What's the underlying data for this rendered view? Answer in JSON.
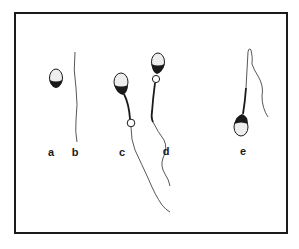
{
  "figure": {
    "type": "sperm-morphology-illustration",
    "panels": [
      {
        "id": "a",
        "label": "a",
        "description": "detached head, no tail"
      },
      {
        "id": "b",
        "label": "b",
        "description": "free tail, no head"
      },
      {
        "id": "c",
        "label": "c",
        "description": "spermatozoon with distal cytoplasmic droplet"
      },
      {
        "id": "d",
        "label": "d",
        "description": "spermatozoon with proximal cytoplasmic droplet"
      },
      {
        "id": "e",
        "label": "e",
        "description": "spermatozoon with bent/coiled tail"
      }
    ]
  },
  "colors": {
    "ink": "#1a1a1a",
    "tail": "#444444",
    "head_fill": "#f2f2f2",
    "background": "#ffffff"
  }
}
